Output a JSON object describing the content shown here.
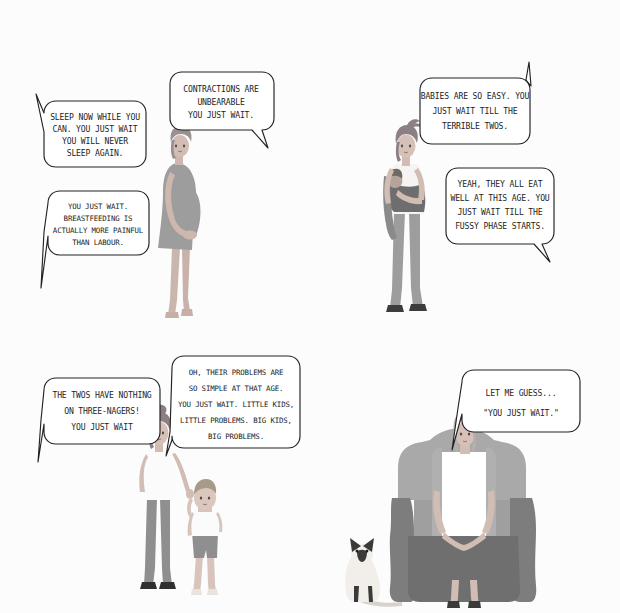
{
  "comic": {
    "title": "You Just Wait",
    "background_color": "#fcfcfc",
    "ink_color": "#222222",
    "layout": "2x2 comic grid",
    "panels": [
      {
        "id": "panel-pregnancy",
        "position": "top-left",
        "scene": "pregnant-woman-standing",
        "figures": [
          {
            "name": "pregnant-woman",
            "skin": "#cfb9b0",
            "hair": "#9a8f93",
            "dress": "#9b9b9b"
          }
        ],
        "bubbles": [
          {
            "name": "bubble-sleep-now",
            "tail": "left-up",
            "lines": [
              "SLEEP NOW WHILE YOU",
              "CAN. YOU JUST WAIT",
              "YOU WILL  NEVER",
              "SLEEP AGAIN."
            ]
          },
          {
            "name": "bubble-contractions",
            "tail": "right-down",
            "lines": [
              "CONTRACTIONS ARE",
              "UNBEARABLE",
              "YOU JUST WAIT."
            ]
          },
          {
            "name": "bubble-breastfeeding",
            "tail": "left-down",
            "lines": [
              "YOU JUST WAIT.",
              "BREASTFEEDING IS",
              "ACTUALLY MORE PAINFUL",
              "THAN LABOUR."
            ]
          }
        ]
      },
      {
        "id": "panel-baby",
        "position": "top-right",
        "scene": "woman-holding-baby-in-sling",
        "figures": [
          {
            "name": "mother-with-baby",
            "skin": "#d2bdb4",
            "hair": "#8d8085",
            "top": "#f3f1ef",
            "trousers": "#9d9d9d",
            "sling": "#6e6e6e"
          }
        ],
        "bubbles": [
          {
            "name": "bubble-babies-easy",
            "tail": "right-up",
            "lines": [
              "BABIES ARE SO EASY. YOU",
              "JUST WAIT TILL THE",
              "TERRIBLE TWOS."
            ]
          },
          {
            "name": "bubble-fussy-phase",
            "tail": "right-down",
            "lines": [
              "YEAH, THEY ALL EAT",
              "WELL AT THIS AGE. YOU",
              "JUST WAIT TILL THE",
              "FUSSY PHASE STARTS."
            ]
          }
        ]
      },
      {
        "id": "panel-toddler",
        "position": "bottom-left",
        "scene": "mother-holding-toddler-hand",
        "figures": [
          {
            "name": "mother",
            "skin": "#d2bdb4",
            "hair": "#8d8085",
            "top": "#fbfbfb",
            "trousers": "#8f8f8f"
          },
          {
            "name": "toddler-boy",
            "skin": "#d8c4bb",
            "hair": "#a79a88",
            "shirt": "#fbfbfb",
            "shorts": "#8f8f8f"
          }
        ],
        "bubbles": [
          {
            "name": "bubble-threenagers",
            "tail": "left-down",
            "lines": [
              "THE TWOS HAVE NOTHING",
              "ON THREE-NAGERS!",
              "YOU JUST WAIT"
            ]
          },
          {
            "name": "bubble-big-problems",
            "tail": "left-down",
            "lines": [
              "OH, THEIR PROBLEMS ARE",
              "SO SIMPLE AT THAT AGE.",
              "YOU JUST WAIT. LITTLE KIDS,",
              "LITTLE PROBLEMS. BIG KIDS,",
              "BIG PROBLEMS."
            ]
          }
        ]
      },
      {
        "id": "panel-grandmother",
        "position": "bottom-right",
        "scene": "older-woman-in-armchair-with-cat",
        "figures": [
          {
            "name": "older-woman",
            "skin": "#d2bdb4",
            "hair": "#b4b0ac",
            "blouse": "#ffffff",
            "skirt": "#6f6f6f"
          },
          {
            "name": "armchair",
            "color": "#a9a9a9",
            "shadow": "#7d7d7d"
          },
          {
            "name": "siamese-cat",
            "body": "#f2eeea",
            "points": "#3a3a3a"
          }
        ],
        "bubbles": [
          {
            "name": "bubble-let-me-guess",
            "tail": "left-down",
            "lines": [
              "LET ME GUESS...",
              "\"YOU JUST WAIT.\""
            ]
          }
        ]
      }
    ]
  }
}
